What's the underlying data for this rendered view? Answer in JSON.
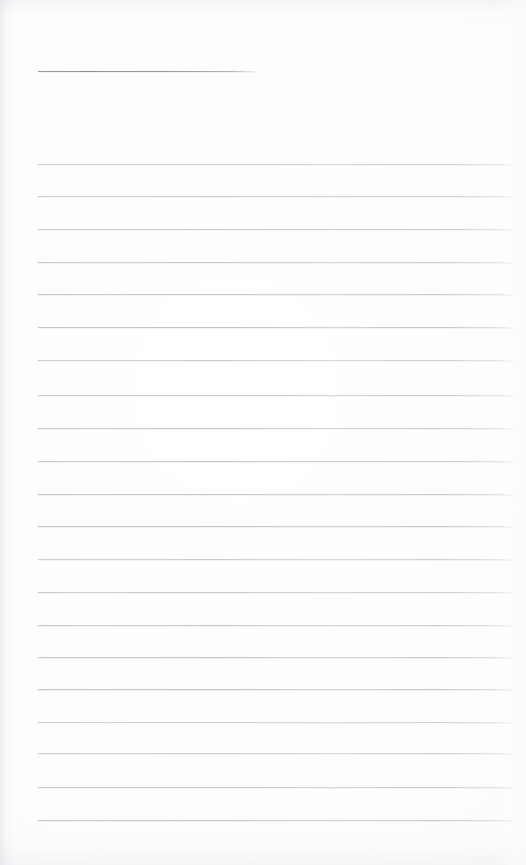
{
  "document": {
    "kind": "scanned-lined-notepad-page",
    "title_text": "",
    "body_text": "",
    "page_width": 526,
    "page_height": 865,
    "background_color": "#fdfdfd",
    "rule_color": "#c0c0ca",
    "title_rule_color": "#94949f"
  },
  "title_rule": {
    "label": "",
    "x": 38,
    "y": 71,
    "width": 219
  },
  "body_rules": [
    {
      "label": "",
      "x": 38,
      "y": 164,
      "width": 475
    },
    {
      "label": "",
      "x": 38,
      "y": 196,
      "width": 475
    },
    {
      "label": "",
      "x": 38,
      "y": 229,
      "width": 475
    },
    {
      "label": "",
      "x": 38,
      "y": 262,
      "width": 475
    },
    {
      "label": "",
      "x": 38,
      "y": 294,
      "width": 475
    },
    {
      "label": "",
      "x": 38,
      "y": 327,
      "width": 475
    },
    {
      "label": "",
      "x": 38,
      "y": 360,
      "width": 475
    },
    {
      "label": "",
      "x": 38,
      "y": 395,
      "width": 475
    },
    {
      "label": "",
      "x": 38,
      "y": 428,
      "width": 475
    },
    {
      "label": "",
      "x": 38,
      "y": 461,
      "width": 475
    },
    {
      "label": "",
      "x": 38,
      "y": 494,
      "width": 475
    },
    {
      "label": "",
      "x": 38,
      "y": 526,
      "width": 475
    },
    {
      "label": "",
      "x": 38,
      "y": 559,
      "width": 475
    },
    {
      "label": "",
      "x": 38,
      "y": 592,
      "width": 475
    },
    {
      "label": "",
      "x": 38,
      "y": 625,
      "width": 475
    },
    {
      "label": "",
      "x": 38,
      "y": 657,
      "width": 475
    },
    {
      "label": "",
      "x": 38,
      "y": 689,
      "width": 475
    },
    {
      "label": "",
      "x": 38,
      "y": 722,
      "width": 475
    },
    {
      "label": "",
      "x": 38,
      "y": 753,
      "width": 475
    },
    {
      "label": "",
      "x": 38,
      "y": 787,
      "width": 475
    },
    {
      "label": "",
      "x": 38,
      "y": 820,
      "width": 475
    }
  ]
}
